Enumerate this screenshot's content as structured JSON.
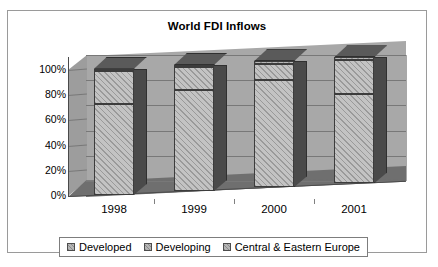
{
  "chart_data": {
    "type": "bar",
    "subtype": "stacked-percent-3d",
    "title": "World FDI Inflows",
    "xlabel": "",
    "ylabel": "",
    "ylim": [
      0,
      100
    ],
    "ytick_labels": [
      "100%",
      "80%",
      "60%",
      "40%",
      "20%",
      "0%"
    ],
    "ytick_values": [
      100,
      80,
      60,
      40,
      20,
      0
    ],
    "grid": true,
    "legend_position": "bottom",
    "categories": [
      "1998",
      "1999",
      "2000",
      "2001"
    ],
    "series": [
      {
        "name": "Developed",
        "values": [
          72,
          80,
          85,
          71
        ]
      },
      {
        "name": "Developing",
        "values": [
          26,
          18,
          13,
          27
        ]
      },
      {
        "name": "Central & Eastern Europe",
        "values": [
          2,
          2,
          2,
          2
        ]
      }
    ]
  },
  "legend": {
    "items": [
      {
        "label": "Developed",
        "swatch": "legend-swatch-developed"
      },
      {
        "label": "Developing",
        "swatch": "legend-swatch-developing"
      },
      {
        "label": "Central & Eastern Europe",
        "swatch": "legend-swatch-cee"
      }
    ]
  },
  "colors": {
    "bar_front": "#c3c3c3",
    "bar_top": "#5a5a5a",
    "bar_side": "#4a4a4a",
    "back_wall": "#a8a8a8",
    "floor": "#6f6f6f",
    "gridline": "#787878",
    "frame": "#9a9a9a",
    "text": "#000000"
  }
}
